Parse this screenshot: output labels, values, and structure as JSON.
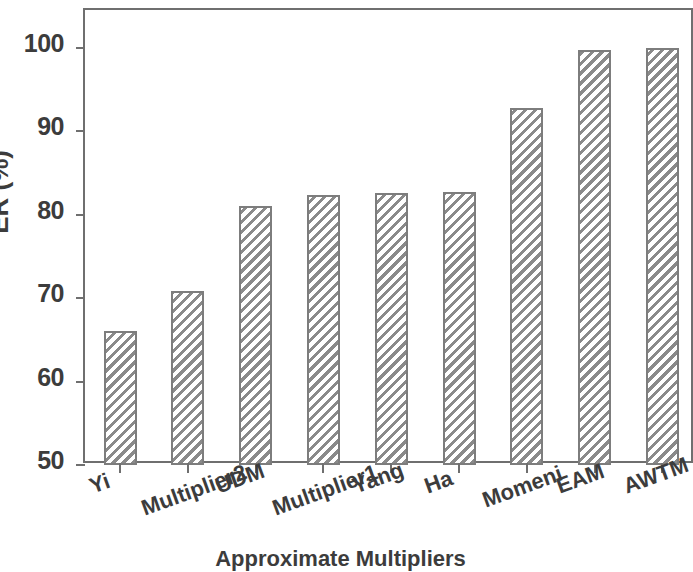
{
  "chart_data": {
    "type": "bar",
    "title": "",
    "xlabel": "Approximate Multipliers",
    "ylabel": "ER (%)",
    "categories": [
      "Yi",
      "Multiplier2",
      "UDM",
      "Multiplier1",
      "Yang",
      "Ha",
      "Momeni",
      "EAM",
      "AWTM"
    ],
    "values": [
      66.1,
      70.8,
      81.0,
      82.3,
      82.6,
      82.7,
      92.8,
      99.7,
      99.9
    ],
    "ylim": [
      50,
      104.5
    ],
    "ytick_labels": [
      "50",
      "60",
      "70",
      "80",
      "90",
      "100"
    ],
    "ytick_values": [
      50,
      60,
      70,
      80,
      90,
      100
    ],
    "grid": false,
    "legend": false,
    "bar_fill": "hatched-diagonal",
    "bar_edge_color": "#7d7d7d",
    "axis_color": "#6f6f6f",
    "xtick_label_rotation": -20
  },
  "figure": {
    "background_color": "#ffffff",
    "text_color": "#3c3c3c"
  }
}
